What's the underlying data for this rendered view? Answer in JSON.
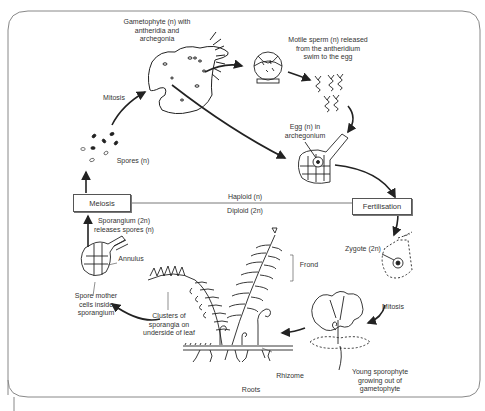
{
  "diagram": {
    "divider": {
      "upper_label": "Haploid (n)",
      "lower_label": "Diploid (2n)"
    },
    "stage_boxes": {
      "meiosis": "Meiosis",
      "fertilisation": "Fertilisation"
    },
    "labels": {
      "gametophyte": "Gametophyte (n) with\nantheridia and\narchegonia",
      "sperm": "Motile sperm (n) released\nfrom the antheridium\nswim to the egg",
      "egg": "Egg (n) in\narchegonium",
      "mitosis_top": "Mitosis",
      "spores": "Spores (n)",
      "sporangium": "Sporangium (2n)\nreleases spores (n)",
      "annulus": "Annulus",
      "spore_mother": "Spore mother\ncells inside\nsporangium",
      "clusters": "Clusters of\nsporangia on\nunderside of leaf",
      "frond": "Frond",
      "rhizome": "Rhizome",
      "roots": "Roots",
      "zygote": "Zygote (2n)",
      "mitosis_bottom": "Mitosis",
      "young_sporophyte": "Young sporophyte\ngrowing out of\ngametophyte"
    },
    "colors": {
      "line": "#222222",
      "border": "#777777",
      "text": "#333333",
      "background": "#ffffff"
    }
  }
}
